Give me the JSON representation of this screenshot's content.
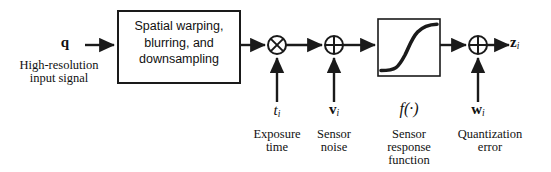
{
  "figure": {
    "type": "block-diagram",
    "background_color": "#ffffff",
    "stroke_color": "#1a1a1a"
  },
  "input": {
    "symbol": "q",
    "label_line1": "High-resolution",
    "label_line2": "input signal"
  },
  "process_block": {
    "line1": "Spatial warping,",
    "line2": "blurring, and",
    "line3": "downsampling"
  },
  "operators": {
    "multiply": "multiply-circle-operator",
    "add": "add-circle-operator",
    "sigmoid": "sigmoid-curve"
  },
  "inputs_below": [
    {
      "symbol": "t",
      "subscript": "i",
      "style": "italic",
      "label_line1": "Exposure",
      "label_line2": "time",
      "label_line3": ""
    },
    {
      "symbol": "v",
      "subscript": "i",
      "style": "bold",
      "label_line1": "Sensor",
      "label_line2": "noise",
      "label_line3": ""
    },
    {
      "symbol": "f(·)",
      "subscript": "",
      "style": "function",
      "label_line1": "Sensor",
      "label_line2": "response",
      "label_line3": "function"
    },
    {
      "symbol": "w",
      "subscript": "i",
      "style": "bold",
      "label_line1": "Quantization",
      "label_line2": "error",
      "label_line3": ""
    }
  ],
  "output": {
    "symbol": "z",
    "subscript": "i"
  }
}
